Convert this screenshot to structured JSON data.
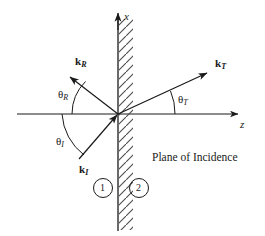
{
  "figure": {
    "title": "Plane of Incidence",
    "kind": "physics-ray-diagram",
    "stroke_color": "#1a1a1a",
    "background_color": "#ffffff"
  },
  "axes": {
    "vertical_label": "x",
    "horizontal_label": "z",
    "origin": {
      "x": 118,
      "y": 114
    }
  },
  "interface": {
    "name": "boundary-surface",
    "hatch_side": "right",
    "top_y": 18,
    "bottom_y": 231
  },
  "rays": [
    {
      "id": "incident",
      "vector_label": "k",
      "vector_subscript": "I",
      "angle_label": "θ",
      "angle_subscript": "I"
    },
    {
      "id": "reflected",
      "vector_label": "k",
      "vector_subscript": "R",
      "angle_label": "θ",
      "angle_subscript": "R"
    },
    {
      "id": "transmitted",
      "vector_label": "k",
      "vector_subscript": "T",
      "angle_label": "θ",
      "angle_subscript": "T"
    }
  ],
  "regions": [
    {
      "id": "medium-1",
      "label": "1"
    },
    {
      "id": "medium-2",
      "label": "2"
    }
  ],
  "caption": "Plane of Incidence"
}
